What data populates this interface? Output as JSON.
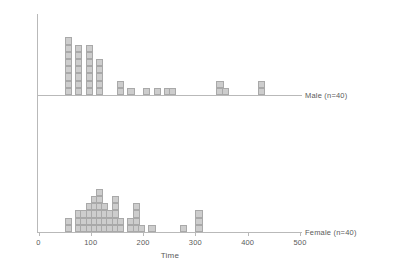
{
  "chart_data": {
    "type": "bar",
    "title": "",
    "subtitle": "",
    "xlabel": "Time",
    "ylabel": "",
    "xlim": [
      0,
      500
    ],
    "grid": false,
    "legend_position": "right",
    "style": "stacked-dot-histogram",
    "bin_width": 20,
    "block_fill": "#cdcdcd",
    "block_stroke": "#a9a9a9",
    "axis_color": "#b9b9b9",
    "text_color": "#5a5a5a",
    "xticks": [
      0,
      100,
      200,
      300,
      400,
      500
    ],
    "xtick_labels": [
      "0",
      "100",
      "200",
      "300",
      "400",
      "500"
    ],
    "series": [
      {
        "name": "Male (n=40)",
        "label": "Male (n=40)",
        "bin_starts": [
          50,
          70,
          90,
          110,
          150,
          170,
          200,
          220,
          240,
          250,
          340,
          350,
          420
        ],
        "counts": [
          8,
          7,
          7,
          5,
          2,
          1,
          1,
          1,
          1,
          1,
          2,
          1,
          2
        ],
        "total": 40
      },
      {
        "name": "Female (n=40)",
        "label": "Female (n=40)",
        "bin_starts": [
          50,
          70,
          80,
          90,
          100,
          110,
          120,
          130,
          140,
          150,
          170,
          180,
          190,
          210,
          270,
          300
        ],
        "counts": [
          2,
          3,
          3,
          4,
          5,
          6,
          4,
          3,
          5,
          2,
          2,
          4,
          1,
          1,
          1,
          3
        ],
        "total": 40
      }
    ]
  },
  "axis": {
    "x_title": "Time",
    "tick_labels": [
      "0",
      "100",
      "200",
      "300",
      "400",
      "500"
    ]
  },
  "labels": {
    "male": "Male (n=40)",
    "female": "Female (n=40)"
  }
}
